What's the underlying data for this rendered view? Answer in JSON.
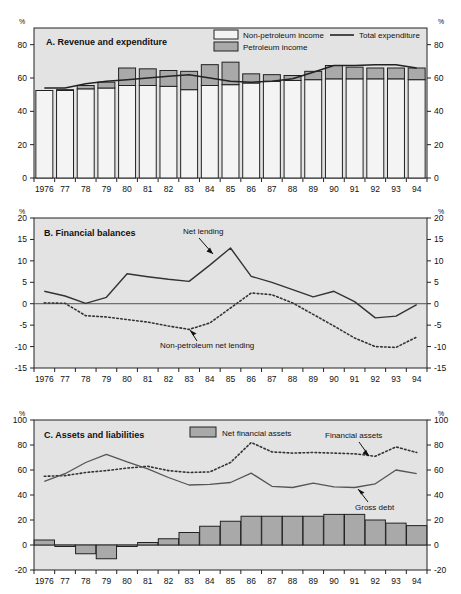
{
  "figure": {
    "unit_label": "%",
    "years": [
      "1976",
      "77",
      "78",
      "79",
      "80",
      "81",
      "82",
      "83",
      "84",
      "85",
      "86",
      "87",
      "88",
      "89",
      "90",
      "91",
      "92",
      "93",
      "94"
    ]
  },
  "panels": [
    {
      "id": "A",
      "letter": "A.",
      "title": "Revenue and expenditure",
      "legend": [
        {
          "name": "non-petroleum-income",
          "label": "Non-petroleum income",
          "type": "swatch",
          "color": "#f2f2f2"
        },
        {
          "name": "petroleum-income",
          "label": "Petroleum income",
          "type": "swatch",
          "color": "#a8a8a8"
        },
        {
          "name": "total-expenditure",
          "label": "Total expenditure",
          "type": "line",
          "color": "#222222"
        }
      ],
      "ylim": [
        0,
        90
      ],
      "yticks": [
        0,
        20,
        40,
        60,
        80
      ],
      "ytick_labels": [
        "0",
        "20",
        "40",
        "60",
        "80"
      ]
    },
    {
      "id": "B",
      "letter": "B.",
      "title": "Financial balances",
      "annotations": [
        {
          "name": "net-lending-annotation",
          "label": "Net  lending"
        },
        {
          "name": "non-petroleum-net-lending-annotation",
          "label": "Non-petroleum net  lending"
        }
      ],
      "ylim": [
        -15,
        20
      ],
      "yticks": [
        -15,
        -10,
        -5,
        0,
        5,
        10,
        15,
        20
      ],
      "ytick_labels": [
        "-15",
        "-10",
        "-5",
        "0",
        "5",
        "10",
        "15",
        "20"
      ]
    },
    {
      "id": "C",
      "letter": "C.",
      "title": "Assets and liabilities",
      "legend": [
        {
          "name": "net-financial-assets",
          "label": "Net financial assets",
          "type": "swatch",
          "color": "#a8a8a8"
        }
      ],
      "annotations": [
        {
          "name": "financial-assets-annotation",
          "label": "Financial assets"
        },
        {
          "name": "gross-debt-annotation",
          "label": "Gross debt"
        }
      ],
      "ylim": [
        -20,
        100
      ],
      "yticks": [
        -20,
        0,
        20,
        40,
        60,
        80,
        100
      ],
      "ytick_labels": [
        "-20",
        "0",
        "20",
        "40",
        "60",
        "80",
        "100"
      ]
    }
  ],
  "chart_data": [
    {
      "type": "bar",
      "title": "A.  Revenue and expenditure",
      "xlabel": "",
      "ylabel": "%",
      "ylim": [
        0,
        90
      ],
      "yticks": [
        0,
        20,
        40,
        60,
        80
      ],
      "grid": false,
      "legend_position": "top-right",
      "categories": [
        "1976",
        "77",
        "78",
        "79",
        "80",
        "81",
        "82",
        "83",
        "84",
        "85",
        "86",
        "87",
        "88",
        "89",
        "90",
        "91",
        "92",
        "93",
        "94"
      ],
      "stacked": true,
      "series": [
        {
          "name": "Non-petroleum income",
          "type": "bar",
          "values": [
            52.5,
            52.5,
            53.5,
            54.0,
            55.5,
            55.5,
            55.0,
            53.0,
            55.5,
            56.0,
            57.0,
            58.0,
            58.5,
            59.0,
            59.5,
            59.5,
            59.5,
            59.5,
            59.0
          ]
        },
        {
          "name": "Petroleum income",
          "type": "bar",
          "values": [
            0.0,
            0.5,
            2.0,
            3.5,
            10.5,
            10.0,
            9.5,
            11.0,
            12.5,
            13.5,
            5.5,
            4.0,
            3.0,
            5.0,
            8.0,
            7.0,
            6.5,
            6.5,
            7.0
          ]
        },
        {
          "name": "Total expenditure",
          "type": "line",
          "values": [
            54.0,
            54.0,
            56.5,
            58.0,
            59.0,
            60.0,
            61.0,
            62.0,
            60.0,
            58.0,
            57.5,
            58.0,
            59.5,
            63.5,
            67.5,
            67.5,
            68.0,
            68.0,
            66.0
          ]
        }
      ]
    },
    {
      "type": "line",
      "title": "B.  Financial balances",
      "xlabel": "",
      "ylabel": "%",
      "ylim": [
        -15,
        20
      ],
      "yticks": [
        -15,
        -10,
        -5,
        0,
        5,
        10,
        15,
        20
      ],
      "grid": false,
      "zero_line": true,
      "categories": [
        "1976",
        "77",
        "78",
        "79",
        "80",
        "81",
        "82",
        "83",
        "84",
        "85",
        "86",
        "87",
        "88",
        "89",
        "90",
        "91",
        "92",
        "93",
        "94"
      ],
      "series": [
        {
          "name": "Net lending",
          "style": "solid",
          "values": [
            2.9,
            1.8,
            0.1,
            1.5,
            7.0,
            6.3,
            5.7,
            5.2,
            9.0,
            13.0,
            6.4,
            5.0,
            3.3,
            1.6,
            2.9,
            0.5,
            -3.3,
            -2.9,
            -0.2
          ]
        },
        {
          "name": "Non-petroleum net lending",
          "style": "dotted",
          "values": [
            0.2,
            0.1,
            -2.8,
            -3.1,
            -3.7,
            -4.3,
            -5.2,
            -6.0,
            -4.5,
            -1.0,
            2.5,
            2.1,
            0.2,
            -2.5,
            -5.2,
            -8.0,
            -10.0,
            -10.2,
            -7.8
          ]
        }
      ]
    },
    {
      "type": "bar",
      "title": "C.  Assets and liabilities",
      "xlabel": "",
      "ylabel": "%",
      "ylim": [
        -20,
        100
      ],
      "yticks": [
        -20,
        0,
        20,
        40,
        60,
        80,
        100
      ],
      "grid": false,
      "zero_line": true,
      "categories": [
        "1976",
        "77",
        "78",
        "79",
        "80",
        "81",
        "82",
        "83",
        "84",
        "85",
        "86",
        "87",
        "88",
        "89",
        "90",
        "91",
        "92",
        "93",
        "94"
      ],
      "series": [
        {
          "name": "Net financial assets",
          "type": "bar",
          "values": [
            4.0,
            -1.0,
            -7.0,
            -11.0,
            -1.0,
            2.0,
            5.0,
            10.0,
            15.0,
            19.0,
            23.0,
            23.0,
            23.0,
            23.0,
            24.5,
            24.5,
            20.0,
            17.5,
            15.5
          ]
        },
        {
          "name": "Financial assets",
          "type": "line",
          "style": "dotted",
          "values": [
            55.0,
            55.5,
            58.0,
            59.5,
            61.5,
            63.0,
            59.5,
            58.0,
            58.5,
            66.0,
            82.0,
            74.5,
            73.5,
            74.0,
            73.5,
            73.0,
            71.0,
            78.5,
            74.0
          ]
        },
        {
          "name": "Gross debt",
          "type": "line",
          "style": "solid",
          "values": [
            51.0,
            57.0,
            66.0,
            72.5,
            66.5,
            61.0,
            54.0,
            48.0,
            48.5,
            50.0,
            57.5,
            47.0,
            46.0,
            49.5,
            46.5,
            46.0,
            49.0,
            60.0,
            57.0
          ]
        }
      ]
    }
  ]
}
